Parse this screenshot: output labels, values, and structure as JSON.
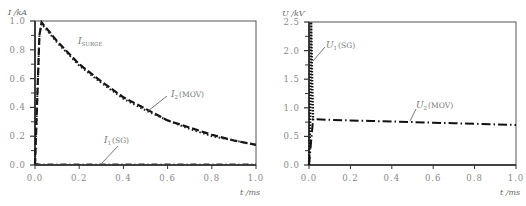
{
  "chart_data": [
    {
      "type": "line",
      "title": "",
      "ylabel": "I /kA",
      "xlabel": "t /ms",
      "xlim": [
        0,
        1.0
      ],
      "ylim": [
        0,
        1.0
      ],
      "xticks": [
        "0.0",
        "0.2",
        "0.4",
        "0.6",
        "0.8",
        "1.0"
      ],
      "yticks": [
        "0.0",
        "0.2",
        "0.4",
        "0.6",
        "0.8",
        "1.0"
      ],
      "grid": false,
      "series": [
        {
          "name": "I_SURGE",
          "label_main": "I",
          "label_sub": "SURGE",
          "x": [
            0,
            0.02,
            0.03,
            0.1,
            0.2,
            0.3,
            0.4,
            0.5,
            0.6,
            0.7,
            0.8,
            0.9,
            1.0
          ],
          "values": [
            0,
            0.9,
            0.99,
            0.86,
            0.7,
            0.58,
            0.47,
            0.39,
            0.31,
            0.26,
            0.21,
            0.17,
            0.14
          ]
        },
        {
          "name": "I2 (MOV)",
          "label_main": "I",
          "label_sub": "2",
          "label_suffix": "(MOV)",
          "x": [
            0,
            0.02,
            0.03,
            0.1,
            0.2,
            0.3,
            0.4,
            0.5,
            0.6,
            0.7,
            0.8,
            0.9,
            1.0
          ],
          "values": [
            0,
            0.9,
            0.98,
            0.85,
            0.69,
            0.57,
            0.46,
            0.38,
            0.31,
            0.25,
            0.2,
            0.17,
            0.14
          ]
        },
        {
          "name": "I1 (SG)",
          "label_main": "I",
          "label_sub": "1",
          "label_suffix": "(SG)",
          "x": [
            0,
            0.01,
            0.02,
            1.0
          ],
          "values": [
            0,
            0.01,
            0.005,
            0.005
          ]
        }
      ]
    },
    {
      "type": "line",
      "title": "",
      "ylabel": "U /kV",
      "xlabel": "t /ms",
      "xlim": [
        0,
        1.0
      ],
      "ylim": [
        0,
        2.5
      ],
      "xticks": [
        "0.0",
        "0.2",
        "0.4",
        "0.6",
        "0.8",
        "1.0"
      ],
      "yticks": [
        "0.0",
        "0.5",
        "1.0",
        "1.5",
        "2.0",
        "2.5"
      ],
      "grid": false,
      "series": [
        {
          "name": "U1 (SG)",
          "label_main": "U",
          "label_sub": "1",
          "label_suffix": "(SG)",
          "x": [
            0,
            0.005,
            0.01,
            0.015,
            0.02
          ],
          "values": [
            0,
            0.6,
            2.5,
            1.5,
            0.78
          ]
        },
        {
          "name": "U2 (MOV)",
          "label_main": "U",
          "label_sub": "2",
          "label_suffix": "(MOV)",
          "x": [
            0,
            0.02,
            0.1,
            0.2,
            0.3,
            0.4,
            0.5,
            0.6,
            0.7,
            0.8,
            0.9,
            1.0
          ],
          "values": [
            0,
            0.8,
            0.79,
            0.78,
            0.77,
            0.76,
            0.75,
            0.74,
            0.73,
            0.72,
            0.71,
            0.7
          ]
        }
      ]
    }
  ]
}
